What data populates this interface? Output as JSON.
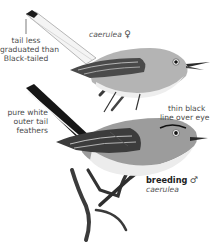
{
  "figure": {
    "birds": [
      {
        "id": "female",
        "label_species": "caerulea",
        "label_sex_symbol": "♀"
      },
      {
        "id": "male",
        "label_plumage": "breeding",
        "label_sex_symbol": "♂",
        "label_species": "caerulea"
      }
    ],
    "annotations": [
      {
        "id": "tail-note",
        "lines": [
          "tail less",
          "graduated than",
          "Black-tailed"
        ]
      },
      {
        "id": "outer-tail-note",
        "lines": [
          "pure white",
          "outer tail",
          "feathers"
        ]
      },
      {
        "id": "eye-line-note",
        "lines": [
          "thin black",
          "line over eye"
        ]
      }
    ],
    "colors": {
      "text": "#4a4a4a",
      "bird_gray": "#9a9a9a",
      "dark": "#1a1a1a"
    }
  }
}
